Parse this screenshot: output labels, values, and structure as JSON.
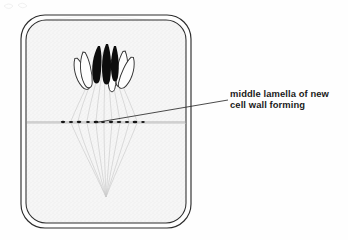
{
  "figure": {
    "kind": "biology-diagram",
    "background_color": "#fefefe",
    "ink_color": "#1a1a1a"
  },
  "annotation": {
    "label_lines": [
      "middle lamella of new",
      "cell wall forming"
    ],
    "full_text": "middle lamella of new cell wall forming",
    "leader_line": {
      "from_x": 228,
      "from_y": 100,
      "to_x": 96,
      "to_y": 122
    }
  },
  "cell": {
    "wall_outer": {
      "x": 21,
      "y": 15,
      "width": 170,
      "height": 213,
      "radius": 24
    },
    "wall_inner": {
      "x": 26,
      "y": 20,
      "width": 160,
      "height": 203,
      "radius": 20
    },
    "cytoplasm_color": "#f4f4f4",
    "wall_color": "#2a2a2a"
  },
  "middle_lamella": {
    "y": 122,
    "x_start": 27,
    "x_end": 186,
    "granule_count": 11,
    "granule_color": "#151515",
    "line_color": "#8c8c8c"
  },
  "spindle": {
    "fiber_count": 9,
    "color": "#c9c9c9",
    "upper_pole_x": 106,
    "upper_pole_y": 44,
    "lower_pole_x": 106,
    "lower_pole_y": 199
  },
  "chromosome_groups": [
    {
      "name": "upper-daughter-set",
      "pole": "top",
      "outlined_count": 4,
      "filled_count": 3,
      "outline_color": "#3a3a3a",
      "fill_color": "#0d0d0d"
    },
    {
      "name": "lower-daughter-set",
      "pole": "bottom",
      "outlined_count": 4,
      "filled_count": 3,
      "outline_color": "#3a3a3a",
      "fill_color": "#0d0d0d"
    }
  ]
}
